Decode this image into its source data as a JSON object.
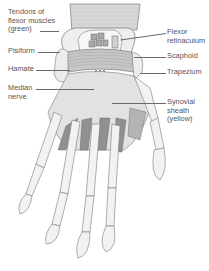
{
  "figure": {
    "colors": {
      "bone_fill": "#f2f2f2",
      "outline": "#7a7a7a",
      "tendon_fill": "#8c8c8c",
      "retinaculum_fill": "#c9c9c9",
      "sheath_fill": "#dcdcdc",
      "forearm_fill": "#d6d6d6"
    }
  },
  "labels": {
    "left": [
      {
        "id": "tendons",
        "text": "Tendons of\nflexor muscles\n(green)"
      },
      {
        "id": "pisiform",
        "text": "Pisiform"
      },
      {
        "id": "hamate",
        "text": "Hamate"
      },
      {
        "id": "median_nerve",
        "text": "Median\nnerve"
      }
    ],
    "right": [
      {
        "id": "flexor_retinaculum",
        "text": "Flexor\nretinaculum"
      },
      {
        "id": "scaphoid",
        "text": "Scaphoid"
      },
      {
        "id": "trapezium",
        "text": "Trapezium"
      },
      {
        "id": "synovial_sheath",
        "text": "Synovial\nsheath\n(yellow)"
      }
    ]
  }
}
